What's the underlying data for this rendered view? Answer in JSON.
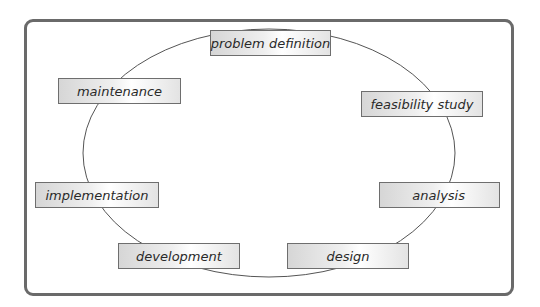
{
  "diagram": {
    "type": "cycle",
    "stages": [
      {
        "id": "problem-definition",
        "label": "problem definition"
      },
      {
        "id": "feasibility-study",
        "label": "feasibility study"
      },
      {
        "id": "analysis",
        "label": "analysis"
      },
      {
        "id": "design",
        "label": "design"
      },
      {
        "id": "development",
        "label": "development"
      },
      {
        "id": "implementation",
        "label": "implementation"
      },
      {
        "id": "maintenance",
        "label": "maintenance"
      }
    ],
    "colors": {
      "frame_border": "#6a6a6a",
      "box_border": "#6e6e6e",
      "cycle_line": "#555555",
      "text": "#2a2a2a"
    }
  }
}
